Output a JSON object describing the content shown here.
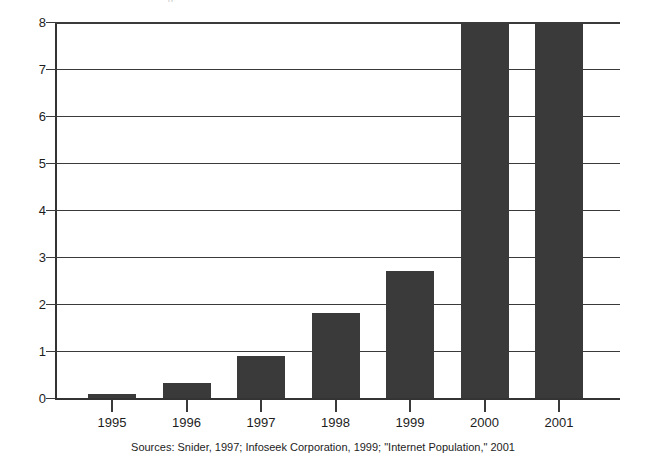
{
  "figure": {
    "title_remnant": "g",
    "caption": "Sources: Snider, 1997; Infoseek Corporation, 1999; \"Internet Population,\" 2001"
  },
  "chart_data": {
    "type": "bar",
    "title": "",
    "subtitle": "",
    "xlabel": "",
    "ylabel": "",
    "categories": [
      "1995",
      "1996",
      "1997",
      "1998",
      "1999",
      "2000",
      "2001"
    ],
    "values": [
      0.08,
      0.32,
      0.9,
      1.8,
      2.7,
      8.1,
      8.1
    ],
    "clipped": [
      false,
      false,
      false,
      false,
      false,
      true,
      true
    ],
    "ylim": [
      0,
      8
    ],
    "yticks": [
      0,
      1,
      2,
      3,
      4,
      5,
      6,
      7,
      8
    ],
    "ytick_labels": [
      "0",
      "1",
      "2",
      "3",
      "4",
      "5",
      "6",
      "7",
      "8"
    ],
    "grid": true,
    "grid_axis": "y",
    "legend": false,
    "legend_position": "none",
    "bar_color": "#3a3a3a",
    "axis_color": "#333333",
    "background": "#ffffff",
    "note": "2000 and 2001 bars extend beyond the top of the plot frame (values exceed the 8 axis maximum)"
  }
}
